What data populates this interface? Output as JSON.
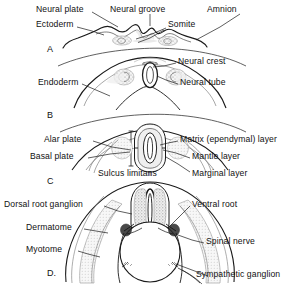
{
  "figure": {
    "background_color": "#ffffff",
    "line_color": "#1a1a1a",
    "tissue_fill": "#f2f2f2",
    "stipple_color": "#8a8a8a"
  },
  "panels": [
    {
      "id": "A",
      "letter": "A",
      "letter_x": 47,
      "letter_y": 44,
      "caption": "Neural plate stage"
    },
    {
      "id": "B",
      "letter": "B",
      "letter_x": 47,
      "letter_y": 110,
      "caption": "Neural tube closure stage"
    },
    {
      "id": "C",
      "letter": "C",
      "letter_x": 47,
      "letter_y": 176,
      "caption": "Layered neural tube stage"
    },
    {
      "id": "D",
      "letter": "D.",
      "letter_x": 47,
      "letter_y": 268,
      "caption": "Spinal cord and peripheral nerve stage"
    }
  ],
  "labels": [
    {
      "id": "neural-plate",
      "text": "Neural plate",
      "x": 36,
      "y": 10,
      "align": "left",
      "panel": "A"
    },
    {
      "id": "neural-groove",
      "text": "Neural groove",
      "x": 110,
      "y": 10,
      "align": "left",
      "panel": "A"
    },
    {
      "id": "amnion",
      "text": "Amnion",
      "x": 207,
      "y": 10,
      "align": "left",
      "panel": "A"
    },
    {
      "id": "ectoderm",
      "text": "Ectoderm",
      "x": 36,
      "y": 24,
      "align": "left",
      "panel": "A"
    },
    {
      "id": "somite",
      "text": "Somite",
      "x": 168,
      "y": 24,
      "align": "left",
      "panel": "A"
    },
    {
      "id": "neural-crest",
      "text": "Neural crest",
      "x": 178,
      "y": 61,
      "align": "left",
      "panel": "B"
    },
    {
      "id": "endoderm",
      "text": "Endoderm",
      "x": 38,
      "y": 82,
      "align": "left",
      "panel": "B"
    },
    {
      "id": "neural-tube",
      "text": "Neural tube",
      "x": 180,
      "y": 82,
      "align": "left",
      "panel": "B"
    },
    {
      "id": "alar-plate",
      "text": "Alar plate",
      "x": 44,
      "y": 139,
      "align": "left",
      "panel": "C"
    },
    {
      "id": "matrix-layer",
      "text": "Matrix (ependymal) layer",
      "x": 180,
      "y": 139,
      "align": "left",
      "panel": "C"
    },
    {
      "id": "basal-plate",
      "text": "Basal plate",
      "x": 30,
      "y": 156,
      "align": "left",
      "panel": "C"
    },
    {
      "id": "mantle-layer",
      "text": "Mantle layer",
      "x": 192,
      "y": 156,
      "align": "left",
      "panel": "C"
    },
    {
      "id": "sulcus-limitans",
      "text": "Sulcus limitans",
      "x": 98,
      "y": 173,
      "align": "left",
      "panel": "C"
    },
    {
      "id": "marginal-layer",
      "text": "Marginal layer",
      "x": 192,
      "y": 173,
      "align": "left",
      "panel": "C"
    },
    {
      "id": "dorsal-root-ganglion",
      "text": "Dorsal root ganglion",
      "x": 4,
      "y": 204,
      "align": "left",
      "panel": "D"
    },
    {
      "id": "ventral-root",
      "text": "Ventral root",
      "x": 192,
      "y": 204,
      "align": "left",
      "panel": "D"
    },
    {
      "id": "dermatome",
      "text": "Dermatome",
      "x": 26,
      "y": 227,
      "align": "left",
      "panel": "D"
    },
    {
      "id": "spinal-nerve",
      "text": "Spinal nerve",
      "x": 206,
      "y": 241,
      "align": "left",
      "panel": "D"
    },
    {
      "id": "myotome",
      "text": "Myotome",
      "x": 26,
      "y": 249,
      "align": "left",
      "panel": "D"
    },
    {
      "id": "sympathetic-ganglion",
      "text": "Sympathetic ganglion",
      "x": 210,
      "y": 274,
      "align": "left",
      "panel": "D"
    }
  ]
}
